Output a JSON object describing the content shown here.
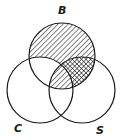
{
  "diagram": {
    "type": "venn-3",
    "sets": [
      {
        "id": "B",
        "label": "B",
        "position": "top",
        "cx": 62,
        "cy": 56,
        "r": 33
      },
      {
        "id": "C",
        "label": "C",
        "position": "bottom-left",
        "cx": 40,
        "cy": 90,
        "r": 33
      },
      {
        "id": "S",
        "label": "S",
        "position": "bottom-right",
        "cx": 82,
        "cy": 90,
        "r": 33
      }
    ],
    "regions": [
      {
        "region": "B only",
        "shading": "single-hatch"
      },
      {
        "region": "B ∩ S only",
        "shading": "cross-hatch"
      },
      {
        "region": "B ∩ C ∩ S",
        "shading": "single-hatch"
      },
      {
        "region": "B ∩ C only",
        "shading": "none"
      },
      {
        "region": "C only",
        "shading": "none"
      },
      {
        "region": "S only",
        "shading": "none"
      },
      {
        "region": "C ∩ S only",
        "shading": "none"
      }
    ],
    "colors": {
      "stroke": "#1a1a1a",
      "background": "#ffffff"
    }
  }
}
